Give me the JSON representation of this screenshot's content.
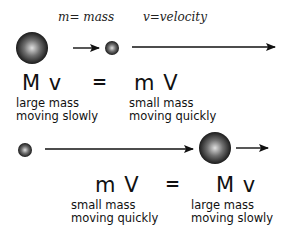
{
  "legend": {
    "mass": "m= mass",
    "velocity": "v=velocity"
  },
  "row1": {
    "left_symbol": "M v",
    "equals": "=",
    "right_symbol": "m V",
    "left_caption": [
      "large mass",
      "moving slowly"
    ],
    "right_caption": [
      "small mass",
      "moving quickly"
    ]
  },
  "row2": {
    "left_symbol": "m V",
    "equals": "=",
    "right_symbol": "M v",
    "left_caption": [
      "small mass",
      "moving quickly"
    ],
    "right_caption": [
      "large mass",
      "moving slowly"
    ]
  },
  "colors": {
    "ball_dark": "#111111",
    "ball_light": "#d8d8d8",
    "arrow": "#111111"
  }
}
